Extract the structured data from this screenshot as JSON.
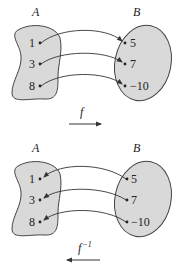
{
  "diagrams": [
    {
      "id": "forward",
      "set_a_label": "A",
      "set_b_label": "B",
      "domain_values": [
        "1",
        "3",
        "8"
      ],
      "range_values": [
        "5",
        "7",
        "−10"
      ],
      "function_label": "f",
      "function_superscript": "",
      "arrow_direction": "right",
      "mappings": [
        [
          "1",
          "5"
        ],
        [
          "3",
          "7"
        ],
        [
          "8",
          "−10"
        ]
      ]
    },
    {
      "id": "inverse",
      "set_a_label": "A",
      "set_b_label": "B",
      "domain_values": [
        "1",
        "3",
        "8"
      ],
      "range_values": [
        "5",
        "7",
        "−10"
      ],
      "function_label": "f",
      "function_superscript": "−1",
      "arrow_direction": "left",
      "mappings": [
        [
          "5",
          "1"
        ],
        [
          "7",
          "3"
        ],
        [
          "−10",
          "8"
        ]
      ]
    }
  ],
  "colors": {
    "set_fill": "#d9d9d9",
    "stroke": "#444444",
    "text": "#222222"
  }
}
